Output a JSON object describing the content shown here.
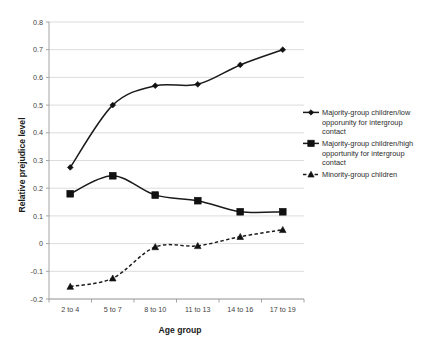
{
  "chart_data": {
    "type": "line",
    "title": "",
    "xlabel": "Age group",
    "ylabel": "Relative prejudice level",
    "categories": [
      "2 to 4",
      "5 to 7",
      "8 to 10",
      "11 to 13",
      "14 to 16",
      "17 to 19"
    ],
    "ylim": [
      -0.2,
      0.8
    ],
    "ytick_step": 0.1,
    "yticks": [
      "0.8",
      "0.7",
      "0.6",
      "0.5",
      "0.4",
      "0.3",
      "0.2",
      "0.1",
      "0",
      "-0.1",
      "-0.2"
    ],
    "grid": true,
    "legend_position": "right",
    "line_color": "#1a1a1a",
    "grid_color": "#d3d3d3",
    "series": [
      {
        "name": "Majority-group children/low opporunity for intergroup contact",
        "marker": "diamond",
        "dash": false,
        "values": [
          0.275,
          0.5,
          0.57,
          0.575,
          0.645,
          0.7
        ]
      },
      {
        "name": "Majority-group children/high opportunity for intergroup contact",
        "marker": "square",
        "dash": false,
        "values": [
          0.18,
          0.245,
          0.175,
          0.155,
          0.115,
          0.115
        ]
      },
      {
        "name": "Minority-group children",
        "marker": "triangle",
        "dash": true,
        "values": [
          -0.155,
          -0.125,
          -0.012,
          -0.008,
          0.025,
          0.05
        ]
      }
    ]
  },
  "legend": {
    "entries": [
      {
        "lines": [
          "Majority-group children/low",
          "opporunity for intergroup",
          "contact"
        ]
      },
      {
        "lines": [
          "Majority-group children/high",
          "opportunity for intergroup",
          "contact"
        ]
      },
      {
        "lines": [
          "Minority-group children"
        ]
      }
    ]
  }
}
